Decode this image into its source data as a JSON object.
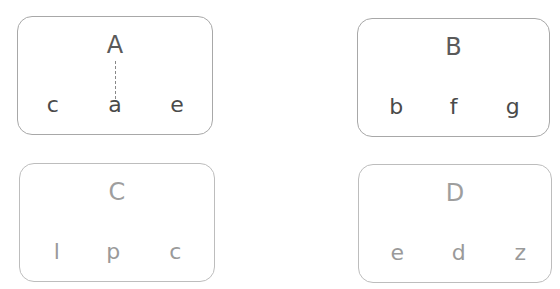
{
  "cards": [
    {
      "label": "A",
      "items": [
        "c",
        "a",
        "e"
      ],
      "linked_item": "a",
      "style": "dark"
    },
    {
      "label": "B",
      "items": [
        "b",
        "f",
        "g"
      ],
      "style": "dark"
    },
    {
      "label": "C",
      "items": [
        "l",
        "p",
        "c"
      ],
      "style": "faded"
    },
    {
      "label": "D",
      "items": [
        "e",
        "d",
        "z"
      ],
      "style": "faded"
    }
  ],
  "colors": {
    "dark_text": "#5a5a5a",
    "faded_text": "#9e9e9e",
    "border": "#a8a8a8"
  }
}
